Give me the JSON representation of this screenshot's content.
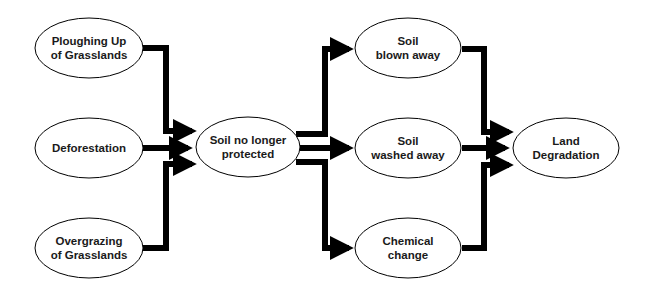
{
  "diagram": {
    "type": "flowchart",
    "colors": {
      "background": "#ffffff",
      "arrow": "#000000",
      "node_border": "#000000",
      "node_fill": "#ffffff",
      "text": "#1a1a1a"
    },
    "nodes": [
      {
        "id": "ploughing",
        "line1": "Ploughing Up",
        "line2": "of Grasslands"
      },
      {
        "id": "deforestation",
        "line1": "Deforestation",
        "line2": ""
      },
      {
        "id": "overgrazing",
        "line1": "Overgrazing",
        "line2": "of Grasslands"
      },
      {
        "id": "soil_unprotected",
        "line1": "Soil no longer",
        "line2": "protected"
      },
      {
        "id": "blown",
        "line1": "Soil",
        "line2": "blown away"
      },
      {
        "id": "washed",
        "line1": "Soil",
        "line2": "washed away"
      },
      {
        "id": "chemical",
        "line1": "Chemical",
        "line2": "change"
      },
      {
        "id": "land_degradation",
        "line1": "Land",
        "line2": "Degradation"
      }
    ],
    "edges": [
      {
        "from": "ploughing",
        "to": "soil_unprotected"
      },
      {
        "from": "deforestation",
        "to": "soil_unprotected"
      },
      {
        "from": "overgrazing",
        "to": "soil_unprotected"
      },
      {
        "from": "soil_unprotected",
        "to": "blown"
      },
      {
        "from": "soil_unprotected",
        "to": "washed"
      },
      {
        "from": "soil_unprotected",
        "to": "chemical"
      },
      {
        "from": "blown",
        "to": "land_degradation"
      },
      {
        "from": "washed",
        "to": "land_degradation"
      },
      {
        "from": "chemical",
        "to": "land_degradation"
      }
    ]
  }
}
